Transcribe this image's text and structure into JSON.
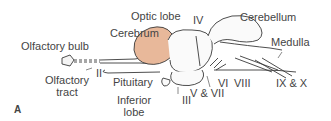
{
  "figure": {
    "panel_label": "A",
    "colors": {
      "cerebrum": "#e8b89a",
      "outline": "#3a3a3a",
      "background": "#ffffff"
    },
    "labels": {
      "olfactory_bulb": "Olfactory bulb",
      "cerebrum": "Cerebrum",
      "optic_lobe": "Optic lobe",
      "iv": "IV",
      "cerebellum": "Cerebellum",
      "medulla": "Medulla",
      "ii": "II",
      "olfactory_tract_1": "Olfactory",
      "olfactory_tract_2": "tract",
      "pituitary": "Pituitary",
      "inferior_lobe_1": "Inferior",
      "inferior_lobe_2": "lobe",
      "iii": "III",
      "v_vii": "V & VII",
      "vi": "VI",
      "viii": "VIII",
      "ix_x": "IX & X"
    }
  }
}
